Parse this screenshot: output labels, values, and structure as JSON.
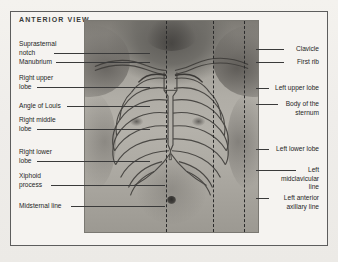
{
  "figure": {
    "view_title": "ANTERIOR VIEW",
    "image_alt": "anterior-chest-photograph"
  },
  "labels_left": [
    {
      "id": "suprasternal-notch",
      "text": "Suprasternal\nnotch"
    },
    {
      "id": "manubrium",
      "text": "Manubrium"
    },
    {
      "id": "right-upper-lobe",
      "text": "Right upper\nlobe"
    },
    {
      "id": "angle-of-louis",
      "text": "Angle of Louis"
    },
    {
      "id": "right-middle-lobe",
      "text": "Right middle\nlobe"
    },
    {
      "id": "right-lower-lobe",
      "text": "Right lower\nlobe"
    },
    {
      "id": "xiphoid-process",
      "text": "Xiphoid\nprocess"
    },
    {
      "id": "midsternal-line",
      "text": "Midsternal line"
    }
  ],
  "labels_right": [
    {
      "id": "clavicle",
      "text": "Clavicle"
    },
    {
      "id": "first-rib",
      "text": "First rib"
    },
    {
      "id": "left-upper-lobe",
      "text": "Left upper lobe"
    },
    {
      "id": "body-of-the-sternum",
      "text": "Body of the\nsternum"
    },
    {
      "id": "left-lower-lobe",
      "text": "Left lower lobe"
    },
    {
      "id": "left-midclavicular-line",
      "text": "Left\nmidclavicular\nline"
    },
    {
      "id": "left-anterior-axillary-line",
      "text": "Left anterior\naxillary line"
    }
  ],
  "reference_lines": [
    {
      "id": "midsternal-dashed-line",
      "name": "Midsternal line"
    },
    {
      "id": "midclavicular-dashed-line",
      "name": "Left midclavicular line"
    },
    {
      "id": "anterior-axillary-dashed-line",
      "name": "Left anterior axillary line"
    }
  ],
  "colors": {
    "page_background": "#f2f0ec",
    "frame_border": "#5d5d5d",
    "text": "#1f1f1f",
    "leader_line": "#3a3a3a",
    "dashed_line": "#2a2a2a"
  }
}
